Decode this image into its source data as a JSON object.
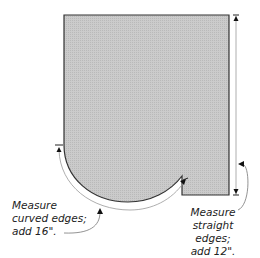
{
  "diagram": {
    "shape": {
      "name": "tablecloth-pattern-piece",
      "fill": "#c8c8c8",
      "stroke": "#333333"
    },
    "annotations": {
      "curved": {
        "lines": [
          "Measure",
          "curved edges;",
          "add 16\"."
        ]
      },
      "straight": {
        "lines": [
          "Measure",
          "straight edges;",
          "add 12\"."
        ]
      }
    },
    "colors": {
      "measure_line": "#888888",
      "arrow": "#111111",
      "text": "#222222"
    }
  }
}
